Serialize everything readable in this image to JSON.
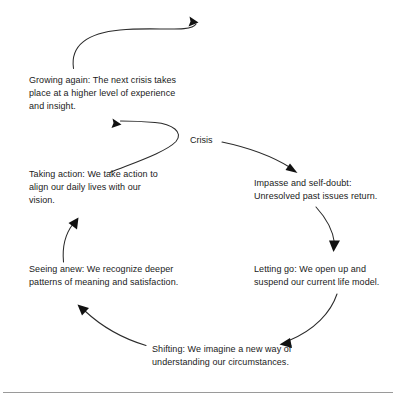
{
  "diagram": {
    "type": "cycle-diagram",
    "center_label": "Crisis",
    "stroke_color": "#2b2b2b",
    "text_color": "#1a1a1a",
    "background_color": "#ffffff",
    "rule_color": "#9a9a9a",
    "nodes": [
      {
        "id": "growing-again",
        "label": "Growing again: The next crisis takes place at a higher level of experience and insight."
      },
      {
        "id": "taking-action",
        "label": "Taking action: We take action to align our daily lives with our vision."
      },
      {
        "id": "seeing-anew",
        "label": "Seeing anew: We recognize deeper patterns of meaning and satisfaction."
      },
      {
        "id": "shifting",
        "label": "Shifting: We imagine a new way of understanding our circumstances."
      },
      {
        "id": "letting-go",
        "label": "Letting go: We open up and suspend our current life model."
      },
      {
        "id": "impasse-self-doubt",
        "label": "Impasse and self-doubt: Unresolved past issues return."
      }
    ],
    "connectors": [
      {
        "id": "crisis-to-impasse",
        "from": "Crisis",
        "to": "Impasse and self-doubt"
      },
      {
        "id": "impasse-to-letting-go",
        "from": "Impasse and self-doubt",
        "to": "Letting go"
      },
      {
        "id": "letting-go-to-shifting",
        "from": "Letting go",
        "to": "Shifting"
      },
      {
        "id": "shifting-to-seeing-anew",
        "from": "Shifting",
        "to": "Seeing anew"
      },
      {
        "id": "seeing-anew-to-taking-action",
        "from": "Seeing anew",
        "to": "Taking action"
      },
      {
        "id": "taking-action-to-growing-again",
        "from": "Taking action",
        "to": "Growing again"
      },
      {
        "id": "growing-again-to-next-crisis",
        "from": "Growing again",
        "to": "Next crisis"
      }
    ]
  }
}
